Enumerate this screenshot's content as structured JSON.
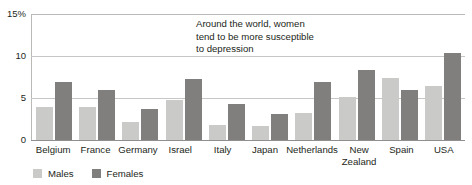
{
  "chart_data": {
    "type": "bar",
    "title": "",
    "subtitle": "",
    "xlabel": "",
    "ylabel": "",
    "ylim": [
      0,
      15
    ],
    "yticks": [
      0,
      5,
      10,
      15
    ],
    "ytick_labels": [
      "0",
      "5",
      "10",
      "15%"
    ],
    "grid": "horizontal",
    "legend_position": "bottom-left",
    "categories": [
      "Belgium",
      "France",
      "Germany",
      "Israel",
      "Italy",
      "Japan",
      "Netherlands",
      "New\nZealand",
      "Spain",
      "USA"
    ],
    "series": [
      {
        "name": "Males",
        "color": "#cacac8",
        "values": [
          3.9,
          3.9,
          2.2,
          4.8,
          1.8,
          1.7,
          3.2,
          5.1,
          7.4,
          6.4
        ]
      },
      {
        "name": "Females",
        "color": "#817f7d",
        "values": [
          6.9,
          6.0,
          3.7,
          7.3,
          4.3,
          3.1,
          6.9,
          8.3,
          5.9,
          10.4
        ]
      }
    ],
    "annotations": [
      {
        "text": "Around the world, women\ntend to be more susceptible\nto depression"
      }
    ]
  },
  "colors": {
    "males": "#cacac8",
    "females": "#817f7d",
    "gridline": "#c6c6c4",
    "axis": "#918f8d",
    "text": "#231f20",
    "background": "#ffffff"
  }
}
